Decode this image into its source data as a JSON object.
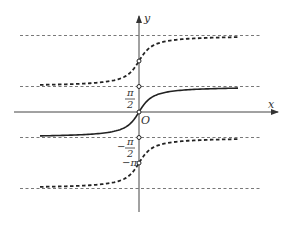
{
  "diagram": {
    "axes": {
      "x_label": "x",
      "y_label": "y",
      "origin_label": "O"
    },
    "asymptotes": [
      {
        "name": "3pi-over-2",
        "value_pi": 1.5
      },
      {
        "name": "pi-over-2",
        "value_pi": 0.5
      },
      {
        "name": "neg-pi-over-2",
        "value_pi": -0.5
      },
      {
        "name": "neg-3pi-over-2",
        "value_pi": -1.5
      }
    ],
    "tick_labels": {
      "pi_over_2": {
        "num": "π",
        "den": "2"
      },
      "neg_pi_over_2": {
        "sign": "−",
        "num": "π",
        "den": "2"
      },
      "neg_pi": "−π"
    },
    "curves": [
      {
        "name": "arctan-main",
        "shift_pi": 0,
        "style": "solid"
      },
      {
        "name": "arctan-plus-pi",
        "shift_pi": 1,
        "style": "dashed"
      },
      {
        "name": "arctan-minus-pi",
        "shift_pi": -1,
        "style": "dashed"
      }
    ],
    "marked_points_pi": [
      1,
      0.5,
      -0.5,
      -1
    ]
  }
}
